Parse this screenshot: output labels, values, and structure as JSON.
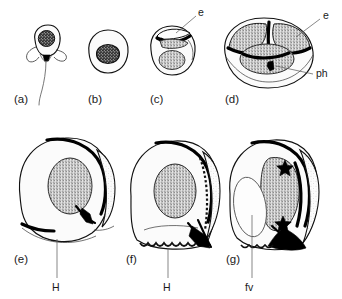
{
  "figure": {
    "kind": "scientific-line-drawing",
    "background_color": "#ffffff",
    "ink_color": "#111111",
    "stipple_color": "#8a8a8a",
    "panel_count": 7
  },
  "panels": [
    {
      "id": "a",
      "letter": "(a)",
      "stage": "flagellated-uninucleate-cell",
      "labels": []
    },
    {
      "id": "b",
      "letter": "(b)",
      "stage": "rounded-cell-with-nucleus",
      "labels": []
    },
    {
      "id": "c",
      "letter": "(c)",
      "stage": "early-invagination",
      "labels": [
        {
          "text": "e",
          "name": "epispore-label"
        }
      ]
    },
    {
      "id": "d",
      "letter": "(d)",
      "stage": "cleft-formation-two-lobes",
      "labels": [
        {
          "text": "e",
          "name": "epispore-label"
        },
        {
          "text": "ph",
          "name": "phialopore-label"
        }
      ]
    },
    {
      "id": "e",
      "letter": "(e)",
      "stage": "expanded-vesicle-early",
      "labels": [
        {
          "text": "H",
          "name": "hilum-label"
        }
      ]
    },
    {
      "id": "f",
      "letter": "(f)",
      "stage": "expanded-vesicle-mid",
      "labels": [
        {
          "text": "H",
          "name": "hilum-label"
        }
      ]
    },
    {
      "id": "g",
      "letter": "(g)",
      "stage": "expanded-vesicle-late-with-food-vacuole",
      "labels": [
        {
          "text": "fv",
          "name": "food-vacuole-label"
        }
      ],
      "markers": [
        {
          "shape": "star",
          "name": "star-marker-upper"
        },
        {
          "shape": "star",
          "name": "star-marker-lower"
        }
      ]
    }
  ],
  "annotation_keys": {
    "e": "e",
    "ph": "ph",
    "H": "H",
    "fv": "fv"
  }
}
